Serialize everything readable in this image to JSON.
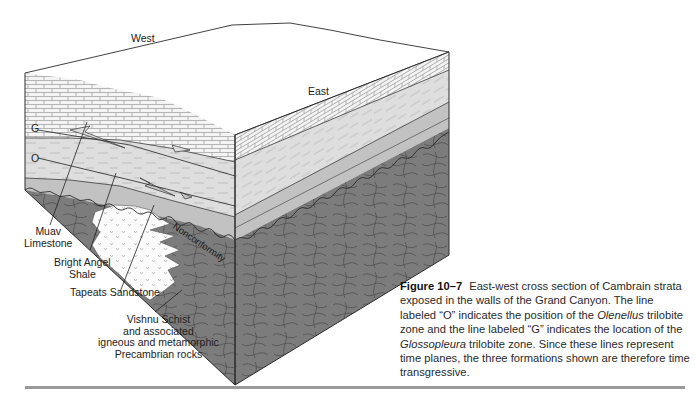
{
  "figure": {
    "direction_labels": {
      "west": "West",
      "east": "East"
    },
    "zone_markers": {
      "g": "G",
      "o": "O"
    },
    "formation_labels": {
      "muav": [
        "Muav",
        "Limestone"
      ],
      "bright_angel": [
        "Bright Angel",
        "Shale"
      ],
      "tapeats": "Tapeats Sandstone",
      "vishnu": [
        "Vishnu Schist",
        "and associated",
        "igneous and metamorphic",
        "Precambrian rocks"
      ],
      "nonconformity": "Nonconformity"
    },
    "colors": {
      "limestone": "#f2f2f2",
      "shale": "#d9d9d9",
      "sandstone_band": "#bdbdbd",
      "schist": "#7a7a7a",
      "granite": "#fbfbfb",
      "outline": "#2b2b2b"
    }
  },
  "caption": {
    "label": "Figure 10–7",
    "text_1": "East-west cross section of Cambrain strata exposed in the walls of the Grand Canyon. The line labeled “O” indicates the position of the ",
    "italic_1": "Olenellus",
    "text_2": " trilobite zone and the line labeled “G” indicates the location of the ",
    "italic_2": "Glossopleura",
    "text_3": " trilobite zone. Since these lines represent time planes, the three formations shown are therefore time transgressive."
  }
}
